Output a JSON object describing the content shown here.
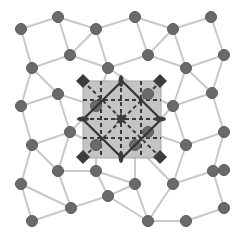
{
  "diagram": {
    "title": "",
    "colors": {
      "background": "#ffffff",
      "edge": "#c8c8c8",
      "node": "#6a6a6a",
      "node_stroke": "#5a5a5a",
      "highlight_fill": "#c4c4c4",
      "highlight_stroke": "#a8a8a8",
      "dashed": "#3a3a3a",
      "diamond": "#3c3c3c",
      "rotated_square": "#333333"
    },
    "nodes": [
      {
        "id": "n0",
        "x": 21,
        "y": 29
      },
      {
        "id": "n1",
        "x": 58,
        "y": 17
      },
      {
        "id": "n2",
        "x": 96,
        "y": 29
      },
      {
        "id": "n3",
        "x": 135,
        "y": 17
      },
      {
        "id": "n4",
        "x": 173,
        "y": 29
      },
      {
        "id": "n5",
        "x": 211,
        "y": 17
      },
      {
        "id": "n6",
        "x": 70,
        "y": 55
      },
      {
        "id": "n7",
        "x": 148,
        "y": 55
      },
      {
        "id": "n8",
        "x": 224,
        "y": 55
      },
      {
        "id": "n9",
        "x": 32,
        "y": 68
      },
      {
        "id": "n10",
        "x": 108,
        "y": 68
      },
      {
        "id": "n11",
        "x": 186,
        "y": 68
      },
      {
        "id": "n12",
        "x": 58,
        "y": 94
      },
      {
        "id": "n13",
        "x": 212,
        "y": 93
      },
      {
        "id": "n14",
        "x": 21,
        "y": 106
      },
      {
        "id": "n15",
        "x": 173,
        "y": 106
      },
      {
        "id": "n16",
        "x": 70,
        "y": 132
      },
      {
        "id": "n17",
        "x": 224,
        "y": 132
      },
      {
        "id": "n18",
        "x": 32,
        "y": 145
      },
      {
        "id": "n19",
        "x": 135,
        "y": 145
      },
      {
        "id": "n20",
        "x": 186,
        "y": 145
      },
      {
        "id": "n21",
        "x": 96,
        "y": 171
      },
      {
        "id": "n22",
        "x": 58,
        "y": 171
      },
      {
        "id": "n23",
        "x": 213,
        "y": 171
      },
      {
        "id": "n24",
        "x": 21,
        "y": 184
      },
      {
        "id": "n25",
        "x": 135,
        "y": 184
      },
      {
        "id": "n26",
        "x": 173,
        "y": 184
      },
      {
        "id": "n27",
        "x": 71,
        "y": 208
      },
      {
        "id": "n28",
        "x": 108,
        "y": 196
      },
      {
        "id": "n29",
        "x": 224,
        "y": 208
      },
      {
        "id": "n30",
        "x": 32,
        "y": 221
      },
      {
        "id": "n31",
        "x": 148,
        "y": 221
      },
      {
        "id": "n32",
        "x": 186,
        "y": 221
      },
      {
        "id": "n33",
        "x": 224,
        "y": 170
      },
      {
        "id": "c1",
        "x": 96,
        "y": 106
      },
      {
        "id": "c2",
        "x": 148,
        "y": 94
      },
      {
        "id": "c3",
        "x": 96,
        "y": 145
      },
      {
        "id": "c4",
        "x": 148,
        "y": 132
      }
    ],
    "edges": [
      [
        "n0",
        "n1"
      ],
      [
        "n1",
        "n2"
      ],
      [
        "n2",
        "n3"
      ],
      [
        "n3",
        "n4"
      ],
      [
        "n4",
        "n5"
      ],
      [
        "n0",
        "n9"
      ],
      [
        "n1",
        "n6"
      ],
      [
        "n2",
        "n6"
      ],
      [
        "n2",
        "n10"
      ],
      [
        "n3",
        "n7"
      ],
      [
        "n4",
        "n7"
      ],
      [
        "n4",
        "n11"
      ],
      [
        "n5",
        "n8"
      ],
      [
        "n6",
        "n9"
      ],
      [
        "n6",
        "n10"
      ],
      [
        "n7",
        "n10"
      ],
      [
        "n7",
        "n11"
      ],
      [
        "n8",
        "n11"
      ],
      [
        "n8",
        "n13"
      ],
      [
        "n9",
        "n12"
      ],
      [
        "n9",
        "n14"
      ],
      [
        "n10",
        "c1"
      ],
      [
        "n10",
        "c2"
      ],
      [
        "n11",
        "n13"
      ],
      [
        "n11",
        "n15"
      ],
      [
        "n12",
        "n14"
      ],
      [
        "n12",
        "n16"
      ],
      [
        "n12",
        "c1"
      ],
      [
        "n13",
        "n15"
      ],
      [
        "n13",
        "n17"
      ],
      [
        "n14",
        "n18"
      ],
      [
        "n15",
        "c2"
      ],
      [
        "n15",
        "n20"
      ],
      [
        "n15",
        "c4"
      ],
      [
        "n16",
        "n18"
      ],
      [
        "n16",
        "n22"
      ],
      [
        "n16",
        "c3"
      ],
      [
        "n16",
        "c1"
      ],
      [
        "n17",
        "n20"
      ],
      [
        "n17",
        "n23"
      ],
      [
        "n18",
        "n22"
      ],
      [
        "n18",
        "n24"
      ],
      [
        "c3",
        "n21"
      ],
      [
        "c3",
        "n19"
      ],
      [
        "c4",
        "n19"
      ],
      [
        "c4",
        "n20"
      ],
      [
        "n19",
        "n25"
      ],
      [
        "n19",
        "n26"
      ],
      [
        "n20",
        "n26"
      ],
      [
        "n21",
        "n22"
      ],
      [
        "n21",
        "n25"
      ],
      [
        "n21",
        "n28"
      ],
      [
        "n22",
        "n27"
      ],
      [
        "n24",
        "n27"
      ],
      [
        "n24",
        "n30"
      ],
      [
        "n25",
        "n28"
      ],
      [
        "n25",
        "n31"
      ],
      [
        "n26",
        "n31"
      ],
      [
        "n26",
        "n23"
      ],
      [
        "n23",
        "n29"
      ],
      [
        "n27",
        "n30"
      ],
      [
        "n27",
        "n28"
      ],
      [
        "n28",
        "n31"
      ],
      [
        "n31",
        "n32"
      ],
      [
        "n32",
        "n29"
      ]
    ],
    "highlight_region": {
      "x": 83,
      "y": 81,
      "width": 78,
      "height": 77
    },
    "dashed_grid": {
      "verticals": [
        101,
        121,
        141
      ],
      "horizontals": [
        100,
        119,
        138
      ]
    },
    "corner_diamonds": [
      {
        "x": 83,
        "y": 81
      },
      {
        "x": 160,
        "y": 81
      },
      {
        "x": 83,
        "y": 157
      },
      {
        "x": 160,
        "y": 157
      }
    ],
    "edge_midpoint_markers": [
      {
        "x": 121,
        "y": 81,
        "orient": "vertical"
      },
      {
        "x": 121,
        "y": 157,
        "orient": "vertical"
      },
      {
        "x": 83,
        "y": 119,
        "orient": "horizontal"
      },
      {
        "x": 160,
        "y": 119,
        "orient": "horizontal"
      }
    ],
    "center_star": {
      "x": 121,
      "y": 119
    }
  }
}
